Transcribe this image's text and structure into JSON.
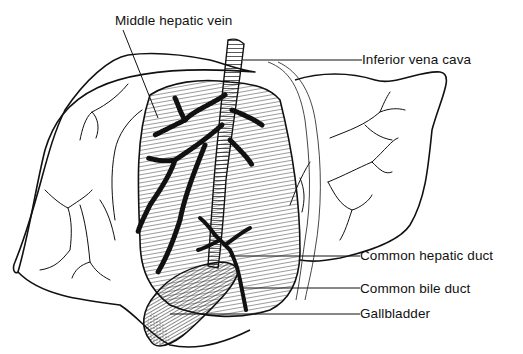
{
  "figure": {
    "style": "black-and-white pen line drawing",
    "colors": {
      "ink": "#111111",
      "background": "#ffffff"
    }
  },
  "labels": [
    {
      "id": "middle-hepatic-vein",
      "text": "Middle hepatic vein"
    },
    {
      "id": "inferior-vena-cava",
      "text": "Inferior vena cava"
    },
    {
      "id": "common-hepatic-duct",
      "text": "Common hepatic duct"
    },
    {
      "id": "common-bile-duct",
      "text": "Common bile duct"
    },
    {
      "id": "gallbladder",
      "text": "Gallbladder"
    }
  ]
}
